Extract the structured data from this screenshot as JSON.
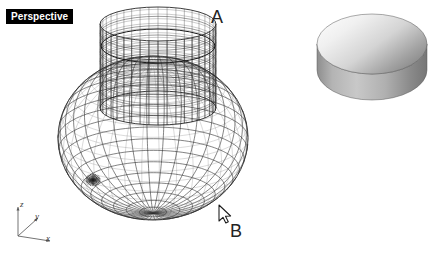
{
  "viewport": {
    "title": "Perspective",
    "background_color": "#ffffff",
    "wire_color": "#2b2b2b",
    "callouts": [
      {
        "id": "A",
        "label": "A",
        "x": 211,
        "y": 8
      },
      {
        "id": "B",
        "label": "B",
        "x": 230,
        "y": 222
      }
    ],
    "cursor": {
      "name": "arrow-pointer",
      "x": 219,
      "y": 206
    }
  },
  "axis_gizmo": {
    "name": "world-axes-indicator",
    "origin": {
      "x": 18,
      "y": 236
    },
    "axes": [
      {
        "label": "z",
        "tip_x": 18,
        "tip_y": 207
      },
      {
        "label": "y",
        "tip_x": 38,
        "tip_y": 218
      },
      {
        "label": "x",
        "tip_x": 50,
        "tip_y": 241
      }
    ]
  },
  "objects": {
    "sphere": {
      "name": "sphere-wireframe",
      "center_x": 153,
      "center_y": 138,
      "radius_x": 95,
      "radius_y": 82,
      "render_mode": "wireframe",
      "meridians": 34,
      "parallels": 22,
      "pole_x": 93,
      "pole_y": 180
    },
    "cylinder": {
      "name": "cylinder-wireframe",
      "center_x": 158,
      "top_y": 24,
      "bottom_y": 108,
      "radius_x": 58,
      "radius_y": 17,
      "render_mode": "wireframe-dense",
      "meridians": 40,
      "parallels": 9
    },
    "disc": {
      "name": "shaded-disc-solid",
      "center_x": 372,
      "top_y": 14,
      "radius_x": 55,
      "radius_y": 30,
      "thickness": 26,
      "render_mode": "shaded",
      "top_light_color": "#f2f2f2",
      "top_dark_color": "#7d7d7d",
      "side_light_color": "#c9c9c9",
      "side_dark_color": "#6e6e6e",
      "edge_color": "#4a4a4a"
    }
  },
  "bottom_caption": {
    "text": " "
  }
}
